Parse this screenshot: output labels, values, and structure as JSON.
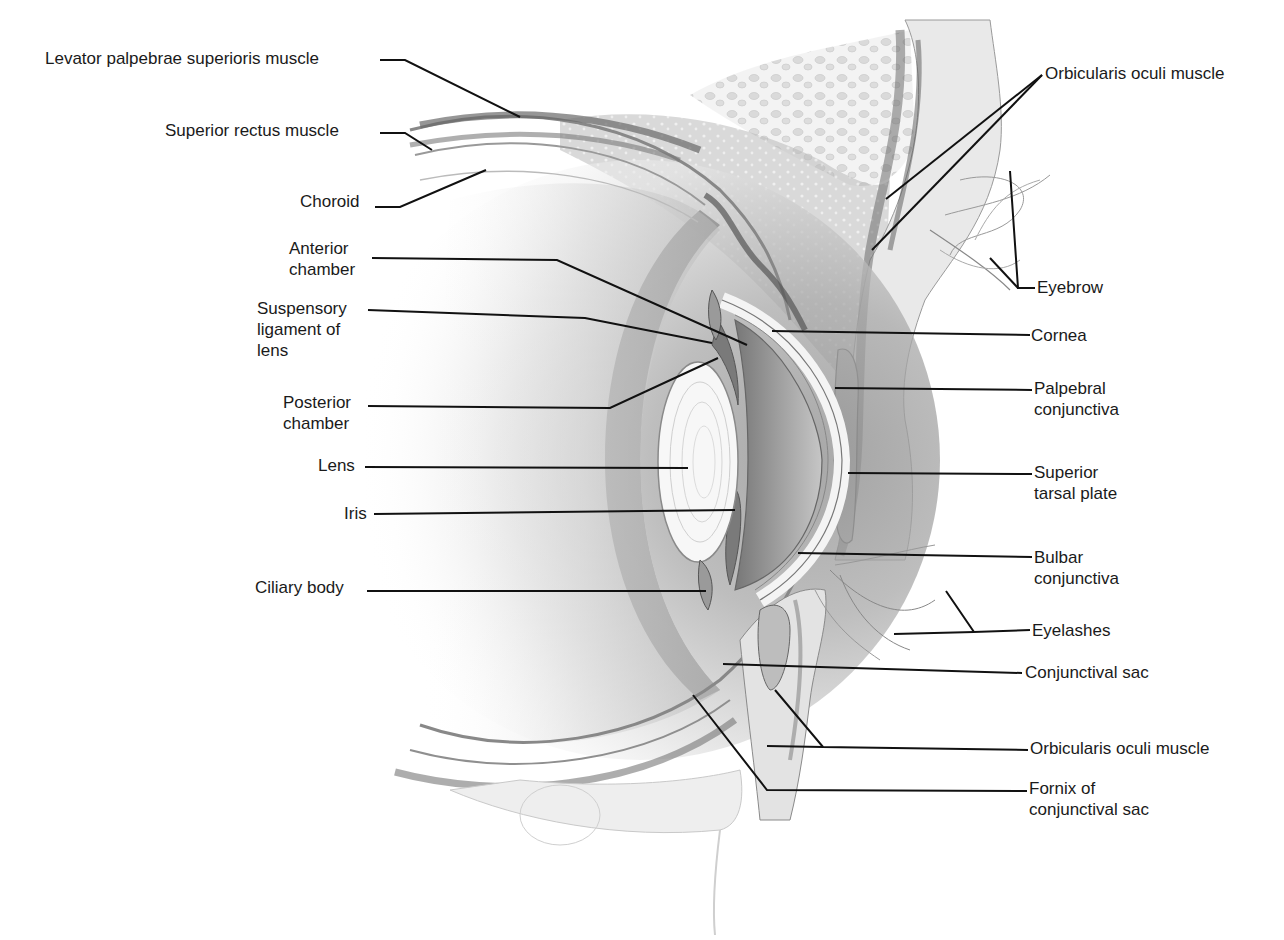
{
  "diagram": {
    "background": "#ffffff",
    "line_color": "#111111",
    "labels": [
      {
        "id": "levator",
        "text": "Levator palpebrae superioris muscle",
        "x": 45,
        "y": 48,
        "align": "left",
        "line": [
          [
            380,
            60
          ],
          [
            405,
            60
          ],
          [
            520,
            117
          ]
        ]
      },
      {
        "id": "superior-rectus",
        "text": "Superior rectus muscle",
        "x": 165,
        "y": 120,
        "align": "left",
        "line": [
          [
            380,
            133
          ],
          [
            405,
            133
          ],
          [
            432,
            150
          ]
        ]
      },
      {
        "id": "choroid",
        "text": "Choroid",
        "x": 300,
        "y": 191,
        "align": "left",
        "line": [
          [
            375,
            207
          ],
          [
            400,
            207
          ],
          [
            486,
            170
          ]
        ]
      },
      {
        "id": "anterior-chamber",
        "text": "Anterior\nchamber",
        "x": 289,
        "y": 238,
        "align": "left",
        "line": [
          [
            372,
            258
          ],
          [
            557,
            260
          ],
          [
            747,
            345
          ]
        ]
      },
      {
        "id": "suspensory-ligament",
        "text": "Suspensory\nligament of\nlens",
        "x": 257,
        "y": 298,
        "align": "left",
        "line": [
          [
            368,
            310
          ],
          [
            585,
            318
          ],
          [
            712,
            343
          ]
        ]
      },
      {
        "id": "posterior-chamber",
        "text": "Posterior\nchamber",
        "x": 283,
        "y": 392,
        "align": "left",
        "line": [
          [
            368,
            406
          ],
          [
            610,
            408
          ],
          [
            718,
            358
          ]
        ]
      },
      {
        "id": "lens",
        "text": "Lens",
        "x": 318,
        "y": 455,
        "align": "left",
        "line": [
          [
            365,
            467
          ],
          [
            688,
            468
          ]
        ]
      },
      {
        "id": "iris",
        "text": "Iris",
        "x": 344,
        "y": 503,
        "align": "left",
        "line": [
          [
            374,
            514
          ],
          [
            735,
            510
          ]
        ]
      },
      {
        "id": "ciliary-body",
        "text": "Ciliary body",
        "x": 255,
        "y": 577,
        "align": "left",
        "line": [
          [
            367,
            591
          ],
          [
            706,
            591
          ]
        ]
      },
      {
        "id": "orbicularis-oculi-upper",
        "text": "Orbicularis oculi muscle",
        "x": 1045,
        "y": 63,
        "align": "left",
        "line": [
          [
            1042,
            75
          ],
          [
            886,
            199
          ]
        ],
        "line2": [
          [
            1042,
            75
          ],
          [
            872,
            250
          ]
        ]
      },
      {
        "id": "eyebrow",
        "text": "Eyebrow",
        "x": 1037,
        "y": 277,
        "align": "left",
        "line": [
          [
            1035,
            288
          ],
          [
            1018,
            288
          ],
          [
            1010,
            171
          ]
        ],
        "line2": [
          [
            1018,
            288
          ],
          [
            990,
            258
          ]
        ]
      },
      {
        "id": "cornea",
        "text": "Cornea",
        "x": 1031,
        "y": 325,
        "align": "left",
        "line": [
          [
            1030,
            335
          ],
          [
            772,
            331
          ]
        ]
      },
      {
        "id": "palpebral-conjunctiva",
        "text": "Palpebral\nconjunctiva",
        "x": 1034,
        "y": 378,
        "align": "left",
        "line": [
          [
            1032,
            390
          ],
          [
            835,
            388
          ]
        ]
      },
      {
        "id": "superior-tarsal-plate",
        "text": "Superior\ntarsal plate",
        "x": 1034,
        "y": 462,
        "align": "left",
        "line": [
          [
            1032,
            474
          ],
          [
            848,
            473
          ]
        ]
      },
      {
        "id": "bulbar-conjunctiva",
        "text": "Bulbar\nconjunctiva",
        "x": 1034,
        "y": 547,
        "align": "left",
        "line": [
          [
            1032,
            557
          ],
          [
            798,
            553
          ]
        ]
      },
      {
        "id": "eyelashes",
        "text": "Eyelashes",
        "x": 1032,
        "y": 620,
        "align": "left",
        "line": [
          [
            1030,
            630
          ],
          [
            974,
            632
          ],
          [
            946,
            591
          ]
        ],
        "line2": [
          [
            974,
            632
          ],
          [
            894,
            634
          ]
        ]
      },
      {
        "id": "conjunctival-sac",
        "text": "Conjunctival sac",
        "x": 1025,
        "y": 662,
        "align": "left",
        "line": [
          [
            1022,
            673
          ],
          [
            723,
            664
          ]
        ]
      },
      {
        "id": "orbicularis-oculi-lower",
        "text": "Orbicularis oculi muscle",
        "x": 1030,
        "y": 738,
        "align": "left",
        "line": [
          [
            1028,
            750
          ],
          [
            823,
            747
          ],
          [
            775,
            690
          ]
        ],
        "line2": [
          [
            823,
            747
          ],
          [
            767,
            746
          ]
        ]
      },
      {
        "id": "fornix",
        "text": "Fornix of\nconjunctival sac",
        "x": 1029,
        "y": 778,
        "align": "left",
        "line": [
          [
            1027,
            791
          ],
          [
            767,
            790
          ],
          [
            693,
            695
          ]
        ]
      }
    ]
  }
}
